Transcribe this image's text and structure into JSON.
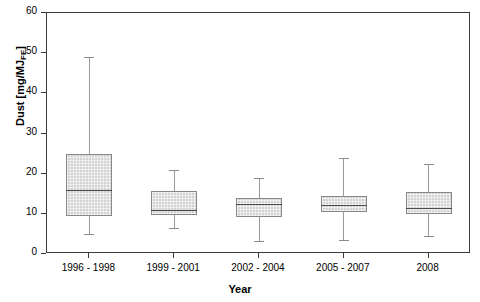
{
  "chart_data": {
    "type": "box",
    "title": "",
    "xlabel": "Year",
    "ylabel": "Dust [mg/MJ",
    "ylabel_sub": "FE",
    "ylabel_suffix": "]",
    "categories": [
      "1996 - 1998",
      "1999 - 2001",
      "2002 - 2004",
      "2005 - 2007",
      "2008"
    ],
    "yticks": [
      0,
      10,
      20,
      30,
      40,
      50,
      60
    ],
    "ylim": [
      0,
      60
    ],
    "grid": false,
    "legend": "none",
    "box_fill": "#d3d3d3",
    "box_border": "#888888",
    "median_color": "#4a4a4a",
    "whisker_color": "#9a9a9a",
    "axis_color": "#3a3a3a",
    "boxes": [
      {
        "category": "1996 - 1998",
        "whisker_low": 5.0,
        "q1": 9.5,
        "median": 16.0,
        "q3": 25.0,
        "whisker_high": 49.0
      },
      {
        "category": "1999 - 2001",
        "whisker_low": 6.5,
        "q1": 9.7,
        "median": 11.0,
        "q3": 15.7,
        "whisker_high": 21.0
      },
      {
        "category": "2002 - 2004",
        "whisker_low": 3.3,
        "q1": 9.2,
        "median": 12.5,
        "q3": 14.0,
        "whisker_high": 19.0
      },
      {
        "category": "2005 - 2007",
        "whisker_low": 3.5,
        "q1": 10.5,
        "median": 12.3,
        "q3": 14.5,
        "whisker_high": 24.0
      },
      {
        "category": "2008",
        "whisker_low": 4.5,
        "q1": 10.0,
        "median": 11.5,
        "q3": 15.5,
        "whisker_high": 22.4
      }
    ]
  }
}
